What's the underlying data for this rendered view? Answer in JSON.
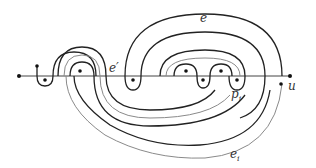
{
  "figure": {
    "colors": {
      "dark_curve": "#222222",
      "light_curve": "#8a8a8a",
      "axis": "#444444",
      "point": "#111111"
    },
    "labels": {
      "e": "e",
      "e_prime": "e′",
      "p_base": "p",
      "p_sub": "i",
      "u": "u",
      "e_i_base": "e",
      "e_i_sub": "i"
    },
    "points": [
      {
        "name": "left-endpoint",
        "x": 19,
        "y": 76
      },
      {
        "name": "puncture-1",
        "x": 37,
        "y": 66
      },
      {
        "name": "puncture-2",
        "x": 45,
        "y": 80
      },
      {
        "name": "puncture-3",
        "x": 80,
        "y": 71
      },
      {
        "name": "puncture-4",
        "x": 133,
        "y": 80
      },
      {
        "name": "puncture-5",
        "x": 186,
        "y": 71
      },
      {
        "name": "puncture-6",
        "x": 203,
        "y": 80
      },
      {
        "name": "puncture-7",
        "x": 221,
        "y": 71
      },
      {
        "name": "p_i",
        "x": 237,
        "y": 80
      },
      {
        "name": "right-endpoint",
        "x": 282,
        "y": 76
      },
      {
        "name": "u",
        "x": 281,
        "y": 84
      }
    ]
  }
}
